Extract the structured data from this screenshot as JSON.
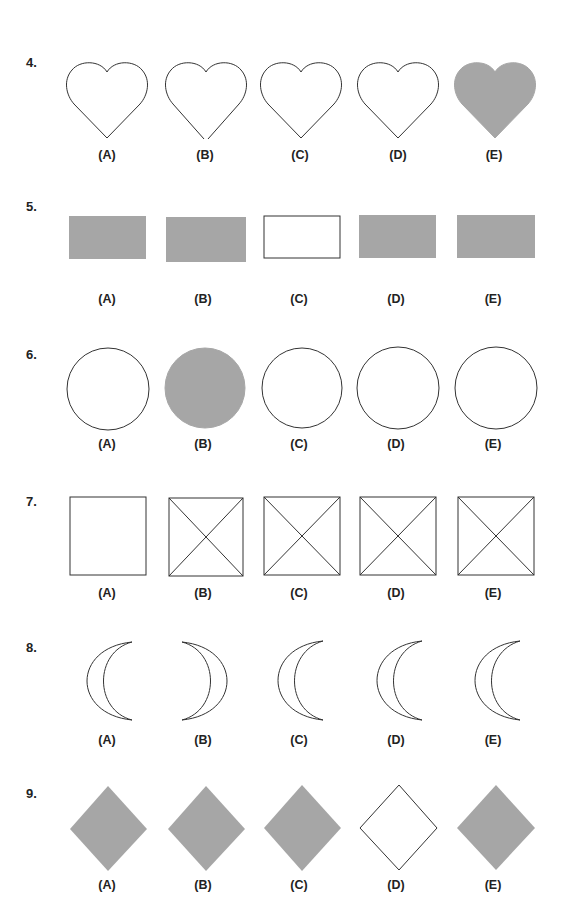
{
  "colors": {
    "fill": "#a6a6a6",
    "stroke": "#333333",
    "background": "#ffffff"
  },
  "questions": [
    {
      "number": "4.",
      "shape": "heart",
      "options": [
        {
          "label": "(A)",
          "filled": false
        },
        {
          "label": "(B)",
          "filled": false,
          "note": "gap at tip"
        },
        {
          "label": "(C)",
          "filled": false
        },
        {
          "label": "(D)",
          "filled": false
        },
        {
          "label": "(E)",
          "filled": true
        }
      ]
    },
    {
      "number": "5.",
      "shape": "rectangle",
      "options": [
        {
          "label": "(A)",
          "filled": true
        },
        {
          "label": "(B)",
          "filled": true
        },
        {
          "label": "(C)",
          "filled": false
        },
        {
          "label": "(D)",
          "filled": true
        },
        {
          "label": "(E)",
          "filled": true
        }
      ]
    },
    {
      "number": "6.",
      "shape": "circle",
      "options": [
        {
          "label": "(A)",
          "filled": false
        },
        {
          "label": "(B)",
          "filled": true
        },
        {
          "label": "(C)",
          "filled": false
        },
        {
          "label": "(D)",
          "filled": false
        },
        {
          "label": "(E)",
          "filled": false
        }
      ]
    },
    {
      "number": "7.",
      "shape": "square",
      "options": [
        {
          "label": "(A)",
          "crossed": false
        },
        {
          "label": "(B)",
          "crossed": true
        },
        {
          "label": "(C)",
          "crossed": true
        },
        {
          "label": "(D)",
          "crossed": true
        },
        {
          "label": "(E)",
          "crossed": true
        }
      ]
    },
    {
      "number": "8.",
      "shape": "crescent",
      "options": [
        {
          "label": "(A)",
          "facing": "left"
        },
        {
          "label": "(B)",
          "facing": "right"
        },
        {
          "label": "(C)",
          "facing": "left"
        },
        {
          "label": "(D)",
          "facing": "left"
        },
        {
          "label": "(E)",
          "facing": "left"
        }
      ]
    },
    {
      "number": "9.",
      "shape": "diamond",
      "options": [
        {
          "label": "(A)",
          "filled": true
        },
        {
          "label": "(B)",
          "filled": true
        },
        {
          "label": "(C)",
          "filled": true
        },
        {
          "label": "(D)",
          "filled": false
        },
        {
          "label": "(E)",
          "filled": true
        }
      ]
    }
  ]
}
